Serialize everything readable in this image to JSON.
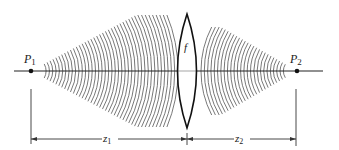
{
  "diagram": {
    "labels": {
      "p1": "P",
      "p1_sub": "1",
      "p2": "P",
      "p2_sub": "2",
      "lens": "f",
      "z1": "z",
      "z1_sub": "1",
      "z2": "z",
      "z2_sub": "2"
    },
    "colors": {
      "line": "#222222",
      "wave": "#555555",
      "background": "#ffffff"
    }
  }
}
